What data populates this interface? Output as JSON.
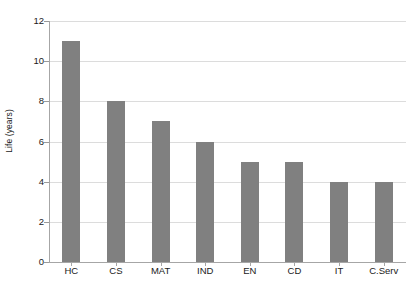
{
  "chart_data": {
    "type": "bar",
    "title": "",
    "subtitle": "",
    "xlabel": "",
    "ylabel": "Life (years)",
    "categories": [
      "HC",
      "CS",
      "MAT",
      "IND",
      "EN",
      "CD",
      "IT",
      "C.Serv"
    ],
    "values": [
      11,
      8,
      7,
      6,
      5,
      5,
      4,
      4
    ],
    "ylim": [
      0,
      12
    ],
    "y_ticks": [
      0,
      2,
      4,
      6,
      8,
      10,
      12
    ],
    "y_tick_labels": [
      "0",
      "2",
      "4",
      "6",
      "8",
      "10",
      "12"
    ],
    "grid": true,
    "grid_axis": "y",
    "legend": false,
    "legend_position": "none",
    "bar_color": "#808080",
    "gridline_color": "#dcdcdc",
    "axis_color": "#a6a6a6",
    "text_color": "#1a1a1a",
    "background_color": "#ffffff",
    "annotations": []
  }
}
